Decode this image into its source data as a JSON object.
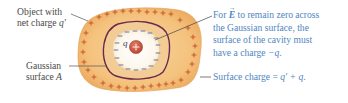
{
  "figure": {
    "colors": {
      "conductor_fill": "#f4c27d",
      "conductor_edge": "#e9a456",
      "plus_sign": "#c8562a",
      "minus_sign": "#6f7fa8",
      "gaussian_surface": "#6b2a4a",
      "cavity_fill": "#fdf7ec",
      "point_charge": "#c9503e",
      "left_label_text": "#4a4a4a",
      "right_label_text": "#4f86bf",
      "leader_line_left": "#555555",
      "leader_line_right": "#444444"
    },
    "labels": {
      "object": {
        "line1": "Object with",
        "line2_prefix": "net charge ",
        "line2_var": "q′"
      },
      "gaussian": {
        "line1": "Gaussian",
        "line2_prefix": "surface ",
        "line2_var": "A"
      },
      "cavity_note": {
        "line1_prefix": "For ",
        "line1_vector": "E",
        "line1_suffix": " to remain zero across",
        "line2": "the Gaussian surface, the",
        "line3": "surface of the cavity must",
        "line4_prefix": "have a charge ",
        "line4_var": "−q",
        "line4_suffix": "."
      },
      "surface_charge": {
        "prefix": "Surface charge = ",
        "expr": "q′ + q",
        "suffix": "."
      },
      "point_charge_symbol": "q",
      "point_charge_sign": "+"
    },
    "signs": {
      "outer_plus": "+",
      "cavity_minus": "−"
    }
  }
}
